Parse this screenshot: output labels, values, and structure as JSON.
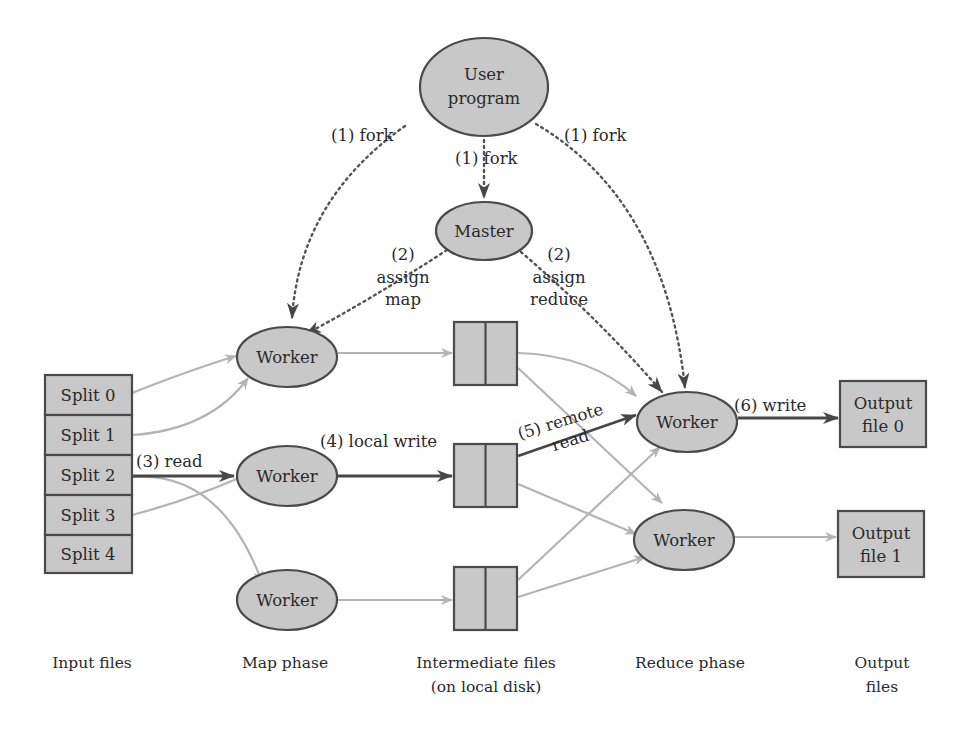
{
  "colors": {
    "node_fill": "#c8c8c8",
    "node_stroke": "#4a4a4a",
    "light_edge": "#b4b4b4",
    "dark_edge": "#474747",
    "text": "#2a2a2a"
  },
  "nodes": {
    "user_program": {
      "line1": "User",
      "line2": "program"
    },
    "master": {
      "label": "Master"
    },
    "map_workers": [
      {
        "label": "Worker"
      },
      {
        "label": "Worker"
      },
      {
        "label": "Worker"
      }
    ],
    "reduce_workers": [
      {
        "label": "Worker"
      },
      {
        "label": "Worker"
      }
    ],
    "splits": [
      "Split 0",
      "Split 1",
      "Split 2",
      "Split 3",
      "Split 4"
    ],
    "outputs": [
      {
        "line1": "Output",
        "line2": "file 0"
      },
      {
        "line1": "Output",
        "line2": "file 1"
      }
    ]
  },
  "edge_labels": {
    "fork_left": "(1) fork",
    "fork_center": "(1) fork",
    "fork_right": "(1) fork",
    "assign_map": {
      "line1": "(2)",
      "line2": "assign",
      "line3": "map"
    },
    "assign_reduce": {
      "line1": "(2)",
      "line2": "assign",
      "line3": "reduce"
    },
    "read": "(3) read",
    "local_write": "(4) local write",
    "remote_read": {
      "line1": "(5) remote",
      "line2": "read"
    },
    "write": "(6) write"
  },
  "phase_captions": {
    "input": "Input files",
    "map": "Map phase",
    "intermediate": {
      "line1": "Intermediate files",
      "line2": "(on local disk)"
    },
    "reduce": "Reduce phase",
    "output": {
      "line1": "Output",
      "line2": "files"
    }
  }
}
